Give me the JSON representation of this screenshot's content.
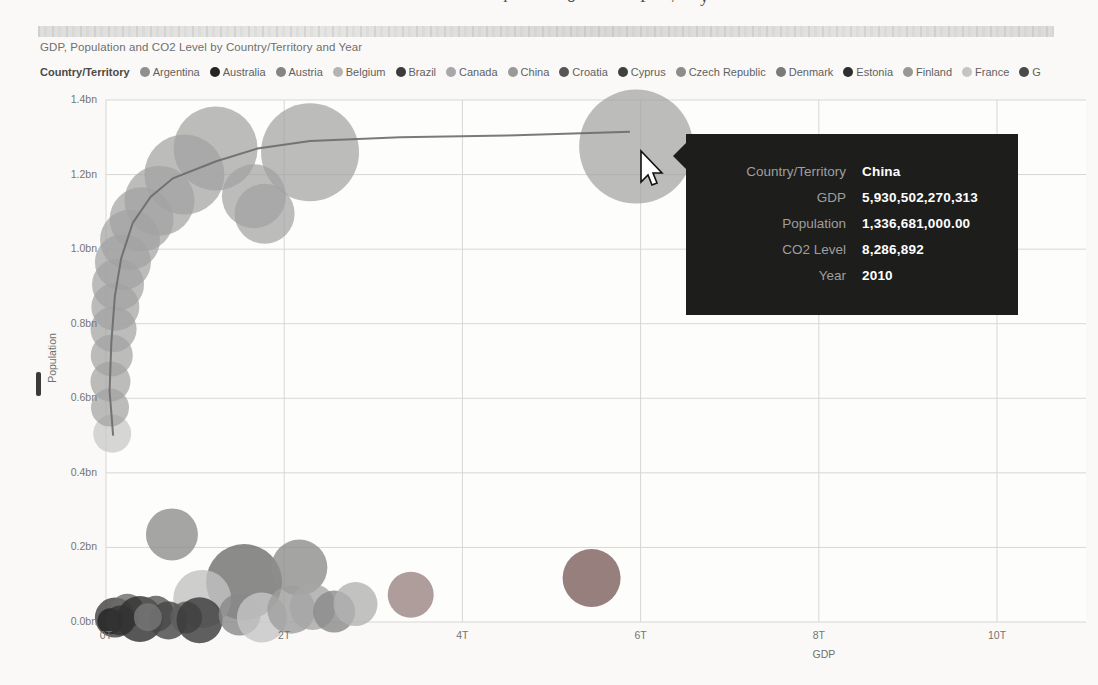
{
  "page": {
    "artifacts": {
      "top_text_fragments": {
        "chars": [
          "l",
          "o",
          "P",
          "/",
          "y"
        ],
        "x": [
          503,
          567,
          640,
          672,
          700
        ]
      }
    }
  },
  "chart": {
    "title": "GDP, Population and CO2 Level by Country/Territory and Year"
  },
  "legend": {
    "title": "Country/Territory",
    "items": [
      {
        "label": "Argentina",
        "color": "#8f8f8f"
      },
      {
        "label": "Australia",
        "color": "#252525"
      },
      {
        "label": "Austria",
        "color": "#858585"
      },
      {
        "label": "Belgium",
        "color": "#b3b3b3"
      },
      {
        "label": "Brazil",
        "color": "#3c3c3c"
      },
      {
        "label": "Canada",
        "color": "#a8a8a8"
      },
      {
        "label": "China",
        "color": "#9a9a9a"
      },
      {
        "label": "Croatia",
        "color": "#565656"
      },
      {
        "label": "Cyprus",
        "color": "#404040"
      },
      {
        "label": "Czech Republic",
        "color": "#8c8c8c"
      },
      {
        "label": "Denmark",
        "color": "#7a7a7a"
      },
      {
        "label": "Estonia",
        "color": "#2e2e2e"
      },
      {
        "label": "Finland",
        "color": "#989898"
      },
      {
        "label": "France",
        "color": "#c4c4c4"
      },
      {
        "label": "G",
        "color": "#4a4a4a"
      }
    ]
  },
  "tooltip": {
    "rows": [
      {
        "label": "Country/Territory",
        "value": "China"
      },
      {
        "label": "GDP",
        "value": "5,930,502,270,313"
      },
      {
        "label": "Population",
        "value": "1,336,681,000.00"
      },
      {
        "label": "CO2 Level",
        "value": "8,286,892"
      },
      {
        "label": "Year",
        "value": "2010"
      }
    ]
  },
  "chart_data": {
    "type": "scatter",
    "title": "GDP, Population and CO2 Level by Country/Territory and Year",
    "xlabel": "GDP",
    "ylabel": "Population",
    "xlim": [
      0,
      11
    ],
    "ylim": [
      0,
      1.4
    ],
    "grid": true,
    "legend_position": "top",
    "x_ticks": {
      "values": [
        0,
        2,
        4,
        6,
        8,
        10
      ],
      "labels": [
        "0T",
        "2T",
        "4T",
        "6T",
        "8T",
        "10T"
      ]
    },
    "y_ticks": {
      "values": [
        0,
        0.2,
        0.4,
        0.6,
        0.8,
        1.0,
        1.2,
        1.4
      ],
      "labels": [
        "0.0bn",
        "0.2bn",
        "0.4bn",
        "0.6bn",
        "0.8bn",
        "1.0bn",
        "1.2bn",
        "1.4bn"
      ]
    },
    "highlighted_point": {
      "country": "China",
      "gdp": "5,930,502,270,313",
      "population": "1,336,681,000.00",
      "co2_level": "8,286,892",
      "year": "2010"
    },
    "china_trail": {
      "bubble_color": "#a2a2a2",
      "line_color": "#6b6b6b",
      "points": [
        {
          "gdp_t": 0.07,
          "pop_bn": 0.505,
          "r": 19,
          "color": "#c6c6c6"
        },
        {
          "gdp_t": 0.045,
          "pop_bn": 0.575,
          "r": 19
        },
        {
          "gdp_t": 0.05,
          "pop_bn": 0.645,
          "r": 20
        },
        {
          "gdp_t": 0.065,
          "pop_bn": 0.715,
          "r": 21
        },
        {
          "gdp_t": 0.085,
          "pop_bn": 0.785,
          "r": 23
        },
        {
          "gdp_t": 0.105,
          "pop_bn": 0.845,
          "r": 24
        },
        {
          "gdp_t": 0.135,
          "pop_bn": 0.905,
          "r": 26
        },
        {
          "gdp_t": 0.19,
          "pop_bn": 0.965,
          "r": 28
        },
        {
          "gdp_t": 0.27,
          "pop_bn": 1.025,
          "r": 30
        },
        {
          "gdp_t": 0.4,
          "pop_bn": 1.08,
          "r": 32
        },
        {
          "gdp_t": 0.6,
          "pop_bn": 1.13,
          "r": 35
        },
        {
          "gdp_t": 0.88,
          "pop_bn": 1.2,
          "r": 40
        },
        {
          "gdp_t": 1.23,
          "pop_bn": 1.27,
          "r": 42
        },
        {
          "gdp_t": 1.66,
          "pop_bn": 1.142,
          "r": 32
        },
        {
          "gdp_t": 1.78,
          "pop_bn": 1.095,
          "r": 30
        },
        {
          "gdp_t": 2.29,
          "pop_bn": 1.26,
          "r": 49
        },
        {
          "gdp_t": 5.95,
          "pop_bn": 1.275,
          "r": 57
        }
      ],
      "line_points": [
        [
          0.08,
          0.5
        ],
        [
          0.04,
          0.62
        ],
        [
          0.06,
          0.75
        ],
        [
          0.1,
          0.875
        ],
        [
          0.17,
          0.975
        ],
        [
          0.3,
          1.07
        ],
        [
          0.5,
          1.14
        ],
        [
          0.75,
          1.19
        ],
        [
          1.23,
          1.235
        ],
        [
          1.7,
          1.27
        ],
        [
          2.29,
          1.29
        ],
        [
          3.3,
          1.3
        ],
        [
          4.5,
          1.305
        ],
        [
          5.88,
          1.315
        ]
      ]
    },
    "other_bubbles": [
      {
        "gdp_t": 0.74,
        "pop_bn": 0.235,
        "r": 26,
        "color": "#8f8f8f"
      },
      {
        "gdp_t": 1.55,
        "pop_bn": 0.107,
        "r": 38,
        "color": "#6e6e6e"
      },
      {
        "gdp_t": 2.17,
        "pop_bn": 0.146,
        "r": 28,
        "color": "#8d8d8d"
      },
      {
        "gdp_t": 1.08,
        "pop_bn": 0.062,
        "r": 29,
        "color": "#c2c2c2"
      },
      {
        "gdp_t": 3.42,
        "pop_bn": 0.073,
        "r": 23,
        "color": "#9b8585"
      },
      {
        "gdp_t": 5.45,
        "pop_bn": 0.118,
        "r": 29,
        "color": "#7d5f5f"
      },
      {
        "gdp_t": 0.1,
        "pop_bn": 0.012,
        "r": 20,
        "color": "#3f3f3f"
      },
      {
        "gdp_t": 0.24,
        "pop_bn": 0.03,
        "r": 17,
        "color": "#6a6a6a"
      },
      {
        "gdp_t": 0.38,
        "pop_bn": 0.008,
        "r": 23,
        "color": "#2e2e2e"
      },
      {
        "gdp_t": 0.56,
        "pop_bn": 0.022,
        "r": 18,
        "color": "#565656"
      },
      {
        "gdp_t": 0.7,
        "pop_bn": 0.004,
        "r": 19,
        "color": "#454545"
      },
      {
        "gdp_t": 0.9,
        "pop_bn": 0.012,
        "r": 16,
        "color": "#5e5e5e"
      },
      {
        "gdp_t": 1.05,
        "pop_bn": 0.005,
        "r": 23,
        "color": "#383838"
      },
      {
        "gdp_t": 1.5,
        "pop_bn": 0.02,
        "r": 21,
        "color": "#888888"
      },
      {
        "gdp_t": 1.75,
        "pop_bn": 0.012,
        "r": 25,
        "color": "#c6c6c6"
      },
      {
        "gdp_t": 2.08,
        "pop_bn": 0.033,
        "r": 24,
        "color": "#9d9d9d"
      },
      {
        "gdp_t": 2.32,
        "pop_bn": 0.04,
        "r": 23,
        "color": "#a6a6a6"
      },
      {
        "gdp_t": 2.56,
        "pop_bn": 0.028,
        "r": 21,
        "color": "#8a8a8a"
      },
      {
        "gdp_t": 2.8,
        "pop_bn": 0.048,
        "r": 22,
        "color": "#b3b3b3"
      },
      {
        "gdp_t": 0.05,
        "pop_bn": 0.002,
        "r": 13,
        "color": "#222222"
      },
      {
        "gdp_t": 0.16,
        "pop_bn": 0.004,
        "r": 15,
        "color": "#333333"
      },
      {
        "gdp_t": 0.47,
        "pop_bn": 0.013,
        "r": 14,
        "color": "#777777"
      }
    ]
  }
}
